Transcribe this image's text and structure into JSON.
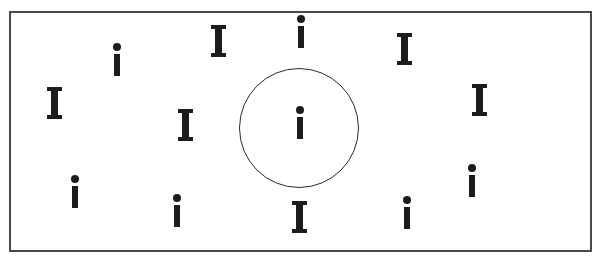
{
  "diagram": {
    "frame": {
      "x": 9,
      "y": 11,
      "width": 583,
      "height": 241,
      "border_color": "#4a4a4a"
    },
    "circle": {
      "cx": 299,
      "cy": 128,
      "r": 60,
      "stroke_color": "#2a2a2a"
    },
    "glyph_color": "#1c1c1c",
    "glyphs": [
      {
        "char": "i",
        "x": 113,
        "y": 43,
        "inside_circle": false
      },
      {
        "char": "I",
        "x": 211,
        "y": 25,
        "inside_circle": false
      },
      {
        "char": "i",
        "x": 297,
        "y": 15,
        "inside_circle": false
      },
      {
        "char": "I",
        "x": 397,
        "y": 33,
        "inside_circle": false
      },
      {
        "char": "I",
        "x": 47,
        "y": 87,
        "inside_circle": false
      },
      {
        "char": "I",
        "x": 178,
        "y": 109,
        "inside_circle": false
      },
      {
        "char": "i",
        "x": 296,
        "y": 106,
        "inside_circle": true
      },
      {
        "char": "I",
        "x": 472,
        "y": 84,
        "inside_circle": false
      },
      {
        "char": "i",
        "x": 71,
        "y": 175,
        "inside_circle": false
      },
      {
        "char": "i",
        "x": 173,
        "y": 194,
        "inside_circle": false
      },
      {
        "char": "I",
        "x": 292,
        "y": 201,
        "inside_circle": false
      },
      {
        "char": "i",
        "x": 403,
        "y": 196,
        "inside_circle": false
      },
      {
        "char": "i",
        "x": 468,
        "y": 164,
        "inside_circle": false
      }
    ],
    "counts": {
      "lowercase_i": 7,
      "uppercase_I": 6
    }
  }
}
